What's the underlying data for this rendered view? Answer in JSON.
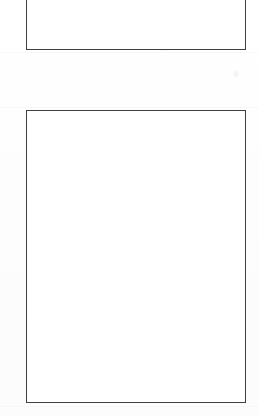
{
  "document": {
    "kind": "scanned-page",
    "page_background_color": "#fdfdfd",
    "canvas": {
      "width": 259,
      "height": 416
    },
    "visible_text": "",
    "notes_label": ""
  },
  "frames": [
    {
      "id": "frame-top",
      "name": "upper-blank-box",
      "label": "",
      "content": "",
      "border_color": "#3f3f3f",
      "fill_color": "#ffffff",
      "x": 26,
      "y": 0,
      "width": 220,
      "height": 50,
      "clipped_top": true
    },
    {
      "id": "frame-main",
      "name": "lower-blank-box",
      "label": "",
      "content": "",
      "border_color": "#3f3f3f",
      "fill_color": "#ffffff",
      "x": 26,
      "y": 110,
      "width": 220,
      "height": 293,
      "clipped_top": false
    }
  ],
  "artifacts": {
    "smudge_label": "",
    "smudge_x": 235,
    "smudge_y": 73
  }
}
